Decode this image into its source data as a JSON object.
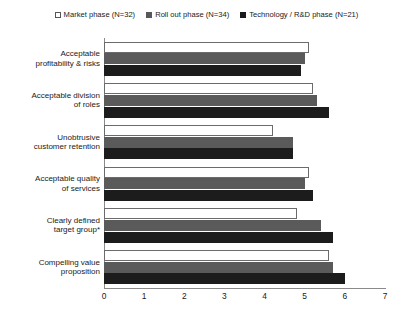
{
  "chart_data": {
    "type": "bar",
    "orientation": "horizontal",
    "title": "",
    "subtitle": "",
    "xlabel": "",
    "ylabel": "",
    "xlim": [
      0,
      7
    ],
    "xticks": [
      0,
      1,
      2,
      3,
      4,
      5,
      6,
      7
    ],
    "xtick_labels": [
      "0",
      "1",
      "2",
      "3",
      "4",
      "5",
      "6",
      "7"
    ],
    "grid": false,
    "legend_position": "top-center",
    "categories": [
      "Acceptable profitability & risks",
      "Acceptable division of roles",
      "Unobtrusive customer retention",
      "Acceptable quality of services",
      "Clearly defined target group*",
      "Compelling value proposition"
    ],
    "category_lines": [
      [
        "Acceptable",
        "profitability & risks"
      ],
      [
        "Acceptable division",
        "of roles"
      ],
      [
        "Unobtrusive",
        "customer retention"
      ],
      [
        "Acceptable quality",
        "of services"
      ],
      [
        "Clearly defined",
        "target group*"
      ],
      [
        "Compelling value",
        "proposition"
      ]
    ],
    "series": [
      {
        "name": "Market phase (N=32)",
        "color": "#ffffff",
        "style": "white",
        "values": [
          5.1,
          5.2,
          4.2,
          5.1,
          4.8,
          5.6
        ]
      },
      {
        "name": "Roll out phase (N=34)",
        "color": "#5a5a5a",
        "style": "gray",
        "values": [
          5.0,
          5.3,
          4.7,
          5.0,
          5.4,
          5.7
        ]
      },
      {
        "name": "Technology / R&D phase (N=21)",
        "color": "#1c1c1c",
        "style": "black",
        "values": [
          4.9,
          5.6,
          4.7,
          5.2,
          5.7,
          6.0
        ]
      }
    ]
  },
  "legend": {
    "entries": [
      {
        "label": "Market phase (N=32)",
        "swatch": "legend-swatch-white"
      },
      {
        "label": "Roll out phase (N=34)",
        "swatch": "legend-swatch-gray"
      },
      {
        "label": "Technology / R&D phase (N=21)",
        "swatch": "legend-swatch-black"
      }
    ]
  }
}
